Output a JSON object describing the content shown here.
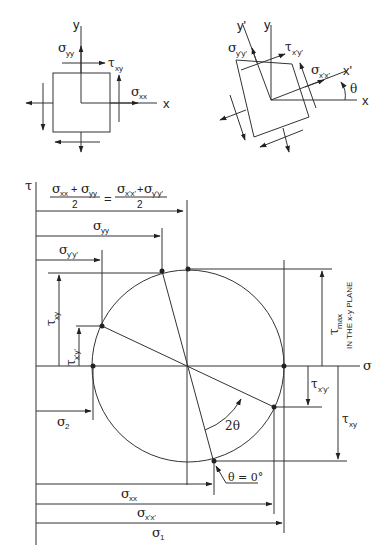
{
  "diagram": {
    "type": "mohrs-circle",
    "element_xy": {
      "axis_x": "x",
      "axis_y": "y",
      "sigma_yy": {
        "sym": "σ",
        "sub": "yy"
      },
      "tau_xy": {
        "sym": "τ",
        "sub": "xy"
      },
      "sigma_xx": {
        "sym": "σ",
        "sub": "xx"
      }
    },
    "element_rotated": {
      "axis_x": "x",
      "axis_y": "y",
      "axis_xp": "x'",
      "axis_yp": "y'",
      "sigma_ypyp": {
        "sym": "σ",
        "sub": "y'y'"
      },
      "tau_xpyp": {
        "sym": "τ",
        "sub": "x'y'"
      },
      "sigma_xpxp": {
        "sym": "σ",
        "sub": "x'x'"
      },
      "theta": "θ"
    },
    "circle": {
      "axis_tau": "τ",
      "axis_sigma": "σ",
      "center_formula": {
        "left_num_a": {
          "sym": "σ",
          "sub": "xx"
        },
        "plus": "+",
        "left_num_b": {
          "sym": "σ",
          "sub": "yy"
        },
        "eq": "=",
        "right_num_a": {
          "sym": "σ",
          "sub": "x'x'"
        },
        "right_num_b": {
          "sym": "σ",
          "sub": "y'y'"
        },
        "denominator": "2"
      },
      "dim_sigma_yy": {
        "sym": "σ",
        "sub": "yy"
      },
      "dim_sigma_ypyp": {
        "sym": "σ",
        "sub": "y'y'"
      },
      "dim_tau_xy_left": {
        "sym": "τ",
        "sub": "xy"
      },
      "dim_tau_xpyp_left": {
        "sym": "τ",
        "sub": "x'y'"
      },
      "dim_sigma_2": {
        "sym": "σ",
        "sub": "2"
      },
      "dim_tau_max": {
        "sym": "τ",
        "sub": "max"
      },
      "plane_note": "IN THE x-y PLANE",
      "dim_tau_xpyp_right": {
        "sym": "τ",
        "sub": "x'y'"
      },
      "dim_tau_xy_right": {
        "sym": "τ",
        "sub": "xy"
      },
      "angle_label": "2θ",
      "theta_zero": "θ = 0°",
      "dim_sigma_xx": {
        "sym": "σ",
        "sub": "xx"
      },
      "dim_sigma_xpxp": {
        "sym": "σ",
        "sub": "x'x'"
      },
      "dim_sigma_1": {
        "sym": "σ",
        "sub": "1"
      }
    }
  }
}
